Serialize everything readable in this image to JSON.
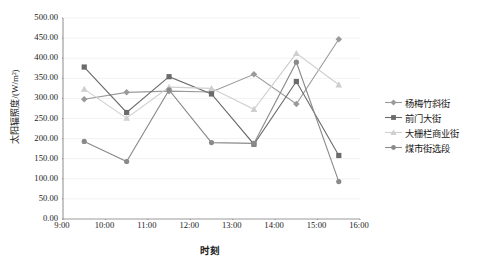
{
  "chart_data": {
    "type": "line",
    "title": "",
    "xlabel": "时刻",
    "ylabel": "太阳辐照度/(W/m²)",
    "grid": true,
    "legend_position": "right",
    "xlim": [
      9,
      16
    ],
    "ylim": [
      0,
      500
    ],
    "x_ticks": [
      "9:00",
      "10:00",
      "11:00",
      "12:00",
      "13:00",
      "14:00",
      "15:00",
      "16:00"
    ],
    "x_tick_values": [
      9,
      10,
      11,
      12,
      13,
      14,
      15,
      16
    ],
    "y_ticks": [
      "0.00",
      "50.00",
      "100.00",
      "150.00",
      "200.00",
      "250.00",
      "300.00",
      "350.00",
      "400.00",
      "450.00",
      "500.00"
    ],
    "y_tick_values": [
      0,
      50,
      100,
      150,
      200,
      250,
      300,
      350,
      400,
      450,
      500
    ],
    "x": [
      9.5,
      10.5,
      11.5,
      12.5,
      13.5,
      14.5,
      15.5
    ],
    "series": [
      {
        "name": "杨梅竹斜街",
        "color": "#9a9a9a",
        "marker": "diamond",
        "values": [
          298,
          315,
          318,
          316,
          360,
          286,
          447
        ]
      },
      {
        "name": "前门大街",
        "color": "#6b6b6b",
        "marker": "square",
        "values": [
          378,
          265,
          354,
          311,
          186,
          342,
          158
        ]
      },
      {
        "name": "大栅栏商业街",
        "color": "#cfcfcf",
        "marker": "triangle",
        "values": [
          323,
          251,
          328,
          325,
          273,
          412,
          334
        ]
      },
      {
        "name": "煤市街选段",
        "color": "#8a8a8a",
        "marker": "circle",
        "values": [
          193,
          143,
          321,
          190,
          188,
          390,
          93
        ]
      }
    ]
  },
  "legend": {
    "items": [
      {
        "label": "杨梅竹斜街"
      },
      {
        "label": "前门大街"
      },
      {
        "label": "大栅栏商业街"
      },
      {
        "label": "煤市街选段"
      }
    ]
  }
}
